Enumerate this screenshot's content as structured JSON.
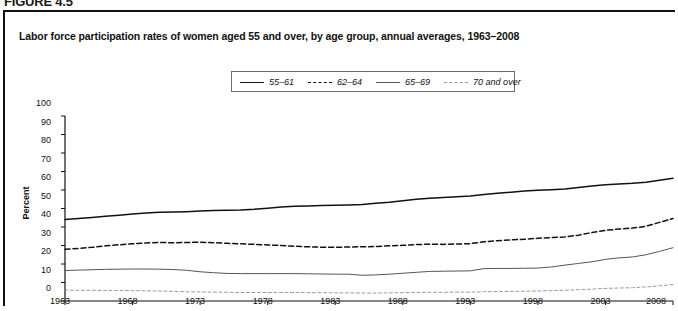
{
  "figure": {
    "tag": "FIGURE 4.5"
  },
  "chart_title": "Labor force participation rates of women aged 55 and over, by age group, annual averages, 1963–2008",
  "legend": {
    "position": "top-center",
    "items": [
      {
        "label": "55–61",
        "style": "solid-thick",
        "color": "#111111"
      },
      {
        "label": "62–64",
        "style": "dashed",
        "color": "#111111"
      },
      {
        "label": "65–69",
        "style": "solid-thin",
        "color": "#555555"
      },
      {
        "label": "70 and over",
        "style": "dotted",
        "color": "#9a9a9a"
      }
    ]
  },
  "chart_data": {
    "type": "line",
    "title": "Labor force participation rates of women aged 55 and over, by age group, annual averages, 1963–2008",
    "xlabel": "",
    "ylabel": "Percent",
    "xlim": [
      1963,
      2008
    ],
    "ylim": [
      0,
      100
    ],
    "ytick_step": 10,
    "yticks": [
      0,
      10,
      20,
      30,
      40,
      50,
      60,
      70,
      80,
      90,
      100
    ],
    "xticks": [
      1963,
      1968,
      1973,
      1978,
      1983,
      1988,
      1993,
      1998,
      2003,
      2008
    ],
    "grid": false,
    "legend_position": "top-center",
    "x": [
      1963,
      1964,
      1965,
      1966,
      1967,
      1968,
      1969,
      1970,
      1971,
      1972,
      1973,
      1974,
      1975,
      1976,
      1977,
      1978,
      1979,
      1980,
      1981,
      1982,
      1983,
      1984,
      1985,
      1986,
      1987,
      1988,
      1989,
      1990,
      1991,
      1992,
      1993,
      1994,
      1995,
      1996,
      1997,
      1998,
      1999,
      2000,
      2001,
      2002,
      2003,
      2004,
      2005,
      2006,
      2007,
      2008
    ],
    "series": [
      {
        "name": "55–61",
        "style": "solid-thick",
        "color": "#111111",
        "values": [
          44.0,
          44.6,
          45.2,
          45.8,
          46.4,
          47.0,
          47.6,
          48.0,
          48.1,
          48.3,
          48.6,
          48.9,
          49.0,
          49.2,
          49.6,
          50.2,
          50.8,
          51.2,
          51.4,
          51.6,
          51.7,
          51.9,
          52.2,
          52.8,
          53.4,
          54.2,
          55.0,
          55.6,
          56.0,
          56.4,
          56.8,
          57.6,
          58.3,
          58.8,
          59.4,
          59.9,
          60.2,
          60.5,
          61.4,
          62.2,
          62.8,
          63.2,
          63.6,
          64.2,
          65.3,
          66.4
        ]
      },
      {
        "name": "62–64",
        "style": "dashed",
        "color": "#111111",
        "values": [
          28.0,
          28.4,
          29.0,
          29.8,
          30.4,
          30.9,
          31.4,
          31.6,
          31.5,
          31.6,
          31.8,
          31.5,
          31.2,
          30.9,
          30.6,
          30.3,
          30.0,
          29.6,
          29.3,
          29.1,
          29.0,
          29.2,
          29.3,
          29.5,
          29.8,
          30.1,
          30.5,
          30.7,
          30.6,
          30.8,
          31.0,
          32.0,
          32.6,
          33.0,
          33.4,
          33.9,
          34.3,
          34.6,
          35.6,
          37.0,
          38.2,
          38.9,
          39.4,
          40.4,
          42.5,
          44.6
        ]
      },
      {
        "name": "65–69",
        "style": "solid-thin",
        "color": "#555555",
        "values": [
          16.5,
          16.7,
          16.9,
          17.1,
          17.2,
          17.3,
          17.3,
          17.2,
          17.0,
          16.6,
          15.8,
          15.3,
          14.9,
          14.8,
          14.8,
          14.8,
          14.8,
          14.8,
          14.7,
          14.6,
          14.5,
          14.5,
          13.9,
          14.1,
          14.5,
          15.0,
          15.5,
          16.0,
          16.1,
          16.2,
          16.3,
          17.5,
          17.6,
          17.6,
          17.7,
          17.8,
          18.4,
          19.4,
          20.3,
          21.2,
          22.5,
          23.3,
          23.8,
          25.0,
          26.8,
          28.8
        ]
      },
      {
        "name": "70 and over",
        "style": "dotted",
        "color": "#9a9a9a",
        "values": [
          5.9,
          5.8,
          5.8,
          5.7,
          5.6,
          5.6,
          5.5,
          5.4,
          5.2,
          5.0,
          4.9,
          4.8,
          4.7,
          4.6,
          4.6,
          4.6,
          4.6,
          4.6,
          4.5,
          4.5,
          4.4,
          4.4,
          4.3,
          4.3,
          4.4,
          4.5,
          4.6,
          4.7,
          4.7,
          4.8,
          4.8,
          5.0,
          5.1,
          5.2,
          5.3,
          5.4,
          5.6,
          5.8,
          6.1,
          6.4,
          6.8,
          7.0,
          7.2,
          7.6,
          8.2,
          8.9
        ]
      }
    ]
  }
}
